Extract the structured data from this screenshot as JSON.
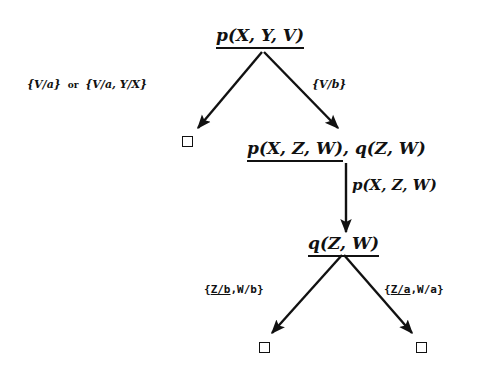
{
  "diagram": {
    "type": "SLD resolution tree",
    "nodes": {
      "root": {
        "selected": "p(X, Y, V)",
        "rest": ""
      },
      "left_leaf": {
        "symbol": "empty-clause-box"
      },
      "node2": {
        "selected": "p(X, Z, W)",
        "rest": ", q(Z, W)"
      },
      "node3": {
        "selected": "q(Z, W)",
        "rest": ""
      },
      "leaf_bl": {
        "symbol": "empty-clause-box"
      },
      "leaf_br": {
        "symbol": "empty-clause-box"
      }
    },
    "edges": {
      "root_left": {
        "label_a": "{V/a}",
        "connector": "or",
        "label_b": "{V/a, Y/X}"
      },
      "root_right": {
        "label": "{V/b}"
      },
      "node2_node3": {
        "label": "p(X, Z, W)"
      },
      "node3_left": {
        "open": "{",
        "underlined": "Z/b",
        "rest": ",W/b}"
      },
      "node3_right": {
        "open": "{",
        "underlined": "Z/a",
        "rest": ",W/a}"
      }
    },
    "colors": {
      "ink": "#111111",
      "background": "#ffffff"
    }
  }
}
